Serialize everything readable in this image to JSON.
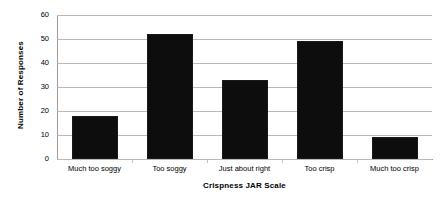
{
  "chart_data": {
    "type": "bar",
    "title": "",
    "subtitle": "",
    "xlabel": "Crispness JAR Scale",
    "ylabel": "Number of Responses",
    "categories": [
      "Much too soggy",
      "Too soggy",
      "Just about right",
      "Too crisp",
      "Much too crisp"
    ],
    "values": [
      18,
      52,
      33,
      49,
      9
    ],
    "ylim": [
      0,
      60
    ],
    "yticks": [
      0,
      10,
      20,
      30,
      40,
      50,
      60
    ],
    "ytick_labels": [
      "0",
      "10",
      "20",
      "30",
      "40",
      "50",
      "60"
    ],
    "grid": "horizontal",
    "legend": "none",
    "bar_color": "#0d0d0d",
    "gridline_color": "#b9b9b9",
    "axis_color": "#9a9a9a",
    "background_color": "#ffffff",
    "text_color": "#000000"
  }
}
